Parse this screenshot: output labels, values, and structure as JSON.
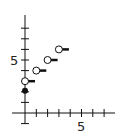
{
  "chart_data": {
    "type": "scatter",
    "title": "",
    "xlabel": "",
    "ylabel": "",
    "x_tick_label": "5",
    "y_tick_label": "5",
    "xlim": [
      -1,
      8
    ],
    "ylim": [
      -1,
      9
    ],
    "grid": false,
    "filled_points": [
      {
        "x": 0,
        "y": 2
      }
    ],
    "open_points": [
      {
        "x": 0,
        "y": 3
      },
      {
        "x": 1,
        "y": 4
      },
      {
        "x": 2,
        "y": 5
      },
      {
        "x": 3,
        "y": 6
      }
    ],
    "segments": [
      {
        "x0": 0,
        "x1": 1,
        "y": 3
      },
      {
        "x0": 1,
        "x1": 2,
        "y": 4
      },
      {
        "x0": 2,
        "x1": 3,
        "y": 5
      },
      {
        "x0": 3,
        "x1": 4,
        "y": 6
      }
    ]
  },
  "labels": {
    "x5": "5",
    "y5": "5"
  },
  "colors": {
    "ink": "#111111"
  }
}
